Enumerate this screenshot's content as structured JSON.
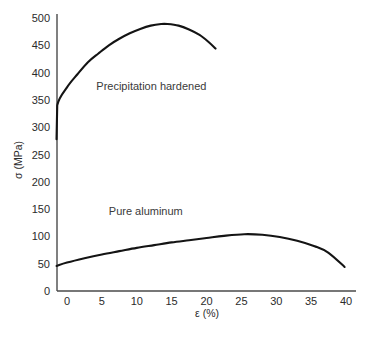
{
  "chart_data": {
    "type": "line",
    "title": "",
    "subtitle": "",
    "xlabel": "ε (%)",
    "ylabel": "σ (MPa)",
    "xlim": [
      -1.5,
      41
    ],
    "ylim": [
      0,
      500
    ],
    "grid": false,
    "legend_position": "inline-annotation",
    "xticks": [
      "0",
      "5",
      "10",
      "15",
      "20",
      "25",
      "30",
      "35",
      "40"
    ],
    "xtick_values": [
      0,
      5,
      10,
      15,
      20,
      25,
      30,
      35,
      40
    ],
    "yticks": [
      "0",
      "50",
      "100",
      "150",
      "200",
      "250",
      "300",
      "350",
      "400",
      "450",
      "500"
    ],
    "ytick_values": [
      0,
      50,
      100,
      150,
      200,
      250,
      300,
      350,
      400,
      450,
      500
    ],
    "series": [
      {
        "name": "Precipitation hardened",
        "annotation": "Precipitation hardened",
        "annotation_at": [
          4.2,
          368
        ],
        "color": "#141414",
        "x": [
          -1.5,
          -1.4,
          0.0,
          1.5,
          3.0,
          4.5,
          6.0,
          7.5,
          9.0,
          10.5,
          12.0,
          13.5,
          14.4,
          16.0,
          17.5,
          19.0,
          20.3,
          21.3
        ],
        "y": [
          278,
          340,
          373,
          397,
          419,
          435,
          450,
          462,
          472,
          480,
          486,
          489,
          489,
          486,
          479,
          469,
          456,
          444
        ]
      },
      {
        "name": "Pure aluminum",
        "annotation": "Pure aluminum",
        "annotation_at": [
          6.0,
          140
        ],
        "color": "#141414",
        "x": [
          -1.5,
          0.0,
          2.5,
          5.0,
          7.5,
          10.0,
          12.5,
          15.0,
          17.5,
          20.0,
          22.5,
          25.4,
          28.0,
          30.5,
          33.0,
          35.5,
          37.5,
          39.8
        ],
        "y": [
          46,
          52,
          60,
          67,
          73,
          79,
          84,
          89,
          93,
          97,
          101,
          104,
          103,
          99,
          92,
          82,
          70,
          44
        ]
      }
    ]
  },
  "axes": {
    "y_axis_title": "σ (MPa)",
    "x_axis_title": "ε (%)"
  }
}
